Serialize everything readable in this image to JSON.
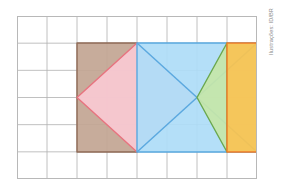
{
  "credit": {
    "text": "Ilustrações: ID/BR"
  },
  "figure": {
    "grid": {
      "columns": 8,
      "rows": 6,
      "cell_width": 30,
      "cell_height": 27.1667,
      "line_color": "#b0b0b0",
      "border_color": "#b8b8b8",
      "background": "#ffffff"
    },
    "colors": {
      "brown_fill": "#c2a592",
      "brown_stroke": "#8f6a55",
      "pink_fill": "#f9c9d2",
      "pink_stroke": "#e8737f",
      "blue_fill": "#aedcf7",
      "blue_stroke": "#5aa9e0",
      "green_fill": "#c5e6a8",
      "green_stroke": "#6aa84f",
      "orange_fill": "#fbc34d",
      "orange_stroke": "#f07c2a"
    },
    "shapes": [
      {
        "name": "brown-rectangle",
        "label": "Brown rectangle",
        "type": "rect",
        "points": "60,27 120,27 120,136 60,136",
        "fill_key": "brown_fill",
        "stroke_key": "brown_stroke"
      },
      {
        "name": "pink-diamond",
        "label": "Pink diamond",
        "type": "polygon",
        "points": "60,81.5 120,27 180,81.5 120,136",
        "fill_key": "pink_fill",
        "stroke_key": "pink_stroke"
      },
      {
        "name": "blue-rectangle",
        "label": "Blue rectangle",
        "type": "rect",
        "points": "120,27 240,27 240,136 120,136",
        "fill_key": "blue_fill",
        "stroke_key": "blue_stroke"
      },
      {
        "name": "blue-diagonal-one",
        "label": "Blue diagonal top-left to bottom-right",
        "type": "line",
        "points": "120,27 240,136",
        "stroke_key": "blue_stroke"
      },
      {
        "name": "blue-diagonal-two",
        "label": "Blue diagonal bottom-left to top-right",
        "type": "line",
        "points": "120,136 240,27",
        "stroke_key": "blue_stroke"
      },
      {
        "name": "green-triangle",
        "label": "Green triangle",
        "type": "polygon",
        "points": "180,81.5 210,27 210,136",
        "fill_key": "green_fill",
        "stroke_key": "green_stroke"
      },
      {
        "name": "orange-rectangle",
        "label": "Orange rectangle",
        "type": "rect",
        "points": "210,27 240,27 240,136 210,136",
        "fill_key": "orange_fill",
        "stroke_key": "orange_stroke"
      }
    ]
  }
}
